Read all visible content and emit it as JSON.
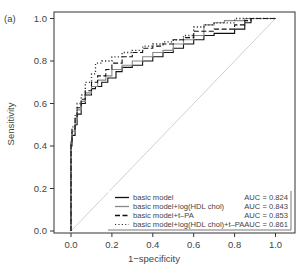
{
  "chart_data": {
    "type": "line",
    "panel_label": "(a)",
    "title": "",
    "xlabel": "1−specificity",
    "ylabel": "Sensitivity",
    "xlim": [
      0,
      1
    ],
    "ylim": [
      0,
      1
    ],
    "x_ticks": [
      "0.0",
      "0.2",
      "0.4",
      "0.6",
      "0.8",
      "1.0"
    ],
    "y_ticks": [
      "0.0",
      "0.2",
      "0.4",
      "0.6",
      "0.8",
      "1.0"
    ],
    "grid": false,
    "legend_position": "bottom-right",
    "reference_line": {
      "from": [
        0,
        0
      ],
      "to": [
        1,
        1
      ],
      "color": "#d0d0d0"
    },
    "series": [
      {
        "name": "basic model",
        "auc_label": "AUC = 0.824",
        "auc": 0.824,
        "style": "solid",
        "color": "#111111",
        "points": [
          [
            0,
            0
          ],
          [
            0,
            0.3
          ],
          [
            0.005,
            0.4
          ],
          [
            0.02,
            0.45
          ],
          [
            0.03,
            0.5
          ],
          [
            0.05,
            0.55
          ],
          [
            0.07,
            0.6
          ],
          [
            0.1,
            0.64
          ],
          [
            0.12,
            0.67
          ],
          [
            0.15,
            0.68
          ],
          [
            0.18,
            0.7
          ],
          [
            0.22,
            0.72
          ],
          [
            0.25,
            0.75
          ],
          [
            0.3,
            0.77
          ],
          [
            0.35,
            0.78
          ],
          [
            0.4,
            0.8
          ],
          [
            0.45,
            0.82
          ],
          [
            0.5,
            0.84
          ],
          [
            0.55,
            0.86
          ],
          [
            0.6,
            0.88
          ],
          [
            0.65,
            0.9
          ],
          [
            0.7,
            0.92
          ],
          [
            0.8,
            0.93
          ],
          [
            0.85,
            0.95
          ],
          [
            0.88,
            0.98
          ],
          [
            0.92,
            1.0
          ],
          [
            1.0,
            1.0
          ]
        ]
      },
      {
        "name": "basic model+log(HDL chol)",
        "auc_label": "AUC = 0.843",
        "auc": 0.843,
        "style": "solid",
        "color": "#888888",
        "points": [
          [
            0,
            0
          ],
          [
            0,
            0.3
          ],
          [
            0.005,
            0.42
          ],
          [
            0.02,
            0.47
          ],
          [
            0.03,
            0.52
          ],
          [
            0.05,
            0.57
          ],
          [
            0.07,
            0.61
          ],
          [
            0.1,
            0.65
          ],
          [
            0.13,
            0.68
          ],
          [
            0.17,
            0.71
          ],
          [
            0.2,
            0.73
          ],
          [
            0.25,
            0.76
          ],
          [
            0.3,
            0.78
          ],
          [
            0.35,
            0.8
          ],
          [
            0.4,
            0.82
          ],
          [
            0.45,
            0.84
          ],
          [
            0.5,
            0.85
          ],
          [
            0.55,
            0.88
          ],
          [
            0.6,
            0.9
          ],
          [
            0.65,
            0.92
          ],
          [
            0.7,
            0.97
          ],
          [
            0.75,
            0.98
          ],
          [
            0.85,
            0.99
          ],
          [
            0.9,
            1.0
          ],
          [
            1.0,
            1.0
          ]
        ]
      },
      {
        "name": "basic model+t–PA",
        "auc_label": "AUC = 0.853",
        "auc": 0.853,
        "style": "dashed",
        "color": "#111111",
        "points": [
          [
            0,
            0
          ],
          [
            0,
            0.3
          ],
          [
            0.005,
            0.42
          ],
          [
            0.02,
            0.48
          ],
          [
            0.03,
            0.53
          ],
          [
            0.05,
            0.58
          ],
          [
            0.07,
            0.62
          ],
          [
            0.1,
            0.66
          ],
          [
            0.13,
            0.7
          ],
          [
            0.17,
            0.73
          ],
          [
            0.2,
            0.76
          ],
          [
            0.25,
            0.79
          ],
          [
            0.3,
            0.82
          ],
          [
            0.35,
            0.84
          ],
          [
            0.4,
            0.86
          ],
          [
            0.45,
            0.87
          ],
          [
            0.5,
            0.88
          ],
          [
            0.55,
            0.9
          ],
          [
            0.6,
            0.91
          ],
          [
            0.7,
            0.94
          ],
          [
            0.8,
            0.95
          ],
          [
            0.85,
            0.97
          ],
          [
            0.88,
            0.99
          ],
          [
            0.92,
            1.0
          ],
          [
            1.0,
            1.0
          ]
        ]
      },
      {
        "name": "basic model+log(HDL chol)+t–PA",
        "auc_label": "AUC = 0.861",
        "auc": 0.861,
        "style": "dotted",
        "color": "#333333",
        "points": [
          [
            0,
            0
          ],
          [
            0,
            0.3
          ],
          [
            0.005,
            0.43
          ],
          [
            0.02,
            0.49
          ],
          [
            0.03,
            0.55
          ],
          [
            0.05,
            0.6
          ],
          [
            0.07,
            0.64
          ],
          [
            0.1,
            0.7
          ],
          [
            0.12,
            0.74
          ],
          [
            0.15,
            0.79
          ],
          [
            0.2,
            0.8
          ],
          [
            0.25,
            0.82
          ],
          [
            0.3,
            0.84
          ],
          [
            0.35,
            0.85
          ],
          [
            0.4,
            0.87
          ],
          [
            0.45,
            0.88
          ],
          [
            0.5,
            0.89
          ],
          [
            0.55,
            0.9
          ],
          [
            0.6,
            0.92
          ],
          [
            0.65,
            0.96
          ],
          [
            0.7,
            0.97
          ],
          [
            0.8,
            0.98
          ],
          [
            0.9,
            1.0
          ],
          [
            1.0,
            1.0
          ]
        ]
      }
    ]
  }
}
